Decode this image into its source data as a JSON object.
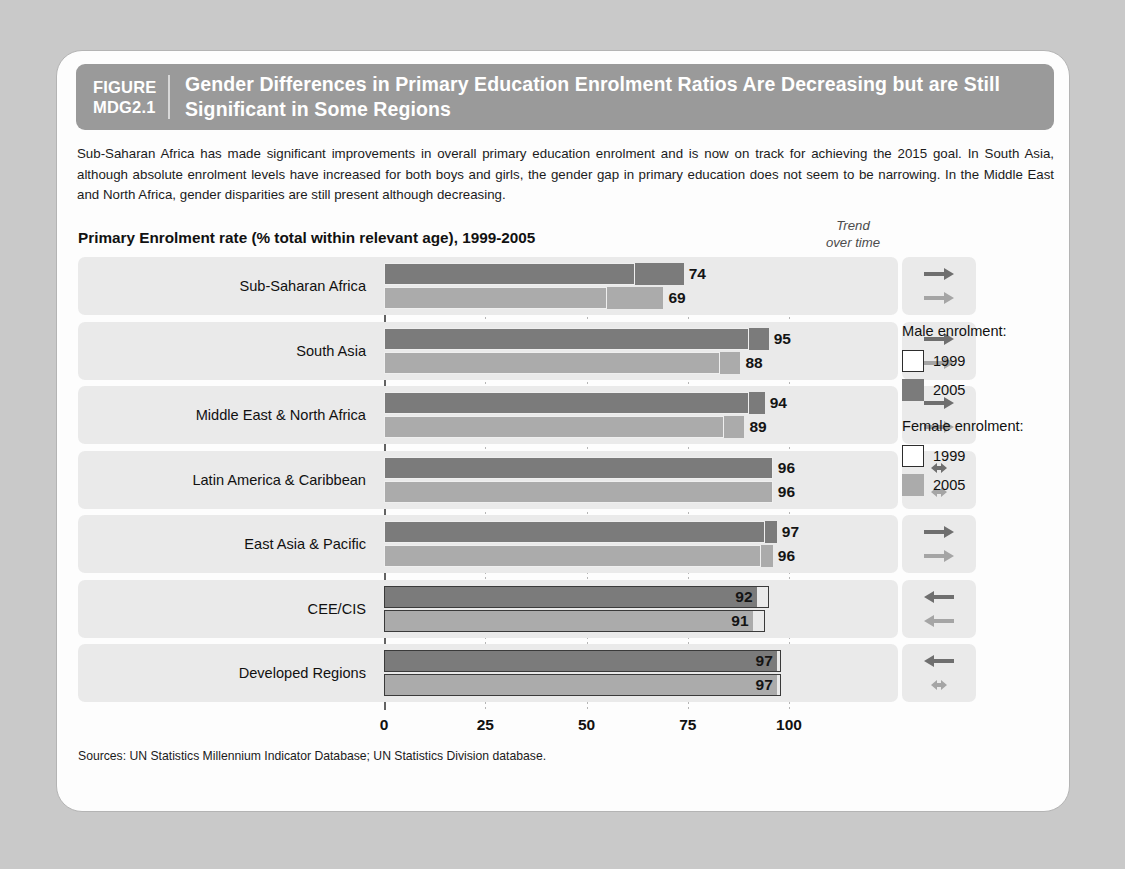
{
  "figure": {
    "number_line1": "FIGURE",
    "number_line2": "MDG2.1",
    "title": "Gender Differences in Primary Education Enrolment Ratios Are Decreasing but are Still Significant in Some Regions"
  },
  "intro": "Sub-Saharan Africa has made significant improvements in overall primary education enrolment and is now on track for achieving the 2015 goal. In South Asia, although absolute enrolment levels have increased for both boys and girls, the gender gap in primary education does not seem to be narrowing. In the Middle East and North Africa, gender disparities are still present although decreasing.",
  "chart_heading": "Primary Enrolment rate (% total within relevant age), 1999-2005",
  "trend_heading_line1": "Trend",
  "trend_heading_line2": "over time",
  "legend": {
    "male_title": "Male enrolment:",
    "male_1999": "1999",
    "male_2005": "2005",
    "female_title": "Female enrolment:",
    "female_1999": "1999",
    "female_2005": "2005"
  },
  "source": "Sources: UN Statistics Millennium Indicator Database; UN Statistics Division database.",
  "colors": {
    "male_2005": "#7b7b7b",
    "female_2005": "#ababab",
    "outline_1999": "#ffffff",
    "row_band": "#eaeaea",
    "header_band": "#9a9a9a",
    "page_background": "#c9c9c9",
    "card_background": "#fdfdfd"
  },
  "chart_data": {
    "type": "bar",
    "orientation": "horizontal",
    "title": "Primary Enrolment rate (% total within relevant age), 1999-2005",
    "xlabel": "",
    "ylabel": "",
    "xlim": [
      0,
      100
    ],
    "xticks": [
      "0",
      "25",
      "50",
      "75",
      "100"
    ],
    "xtick_values": [
      0,
      25,
      50,
      75,
      100
    ],
    "grid": true,
    "legend_position": "right",
    "categories": [
      "Sub-Saharan Africa",
      "South Asia",
      "Middle East & North Africa",
      "Latin America & Caribbean",
      "East Asia & Pacific",
      "CEE/CIS",
      "Developed Regions"
    ],
    "series": [
      {
        "name": "Male enrolment 2005",
        "values": [
          74,
          95,
          94,
          96,
          97,
          92,
          97
        ]
      },
      {
        "name": "Female enrolment 2005",
        "values": [
          69,
          88,
          89,
          96,
          96,
          91,
          97
        ]
      },
      {
        "name": "Male enrolment 1999",
        "values": [
          62,
          90,
          90,
          96,
          94,
          95,
          98
        ]
      },
      {
        "name": "Female enrolment 1999",
        "values": [
          55,
          83,
          84,
          96,
          93,
          94,
          98
        ]
      }
    ],
    "rows": [
      {
        "region": "Sub-Saharan Africa",
        "male_2005": 74,
        "male_1999": 62,
        "female_2005": 69,
        "female_1999": 55,
        "male_label": "74",
        "female_label": "69",
        "male_trend": "arrow-right",
        "female_trend": "arrow-right"
      },
      {
        "region": "South Asia",
        "male_2005": 95,
        "male_1999": 90,
        "female_2005": 88,
        "female_1999": 83,
        "male_label": "95",
        "female_label": "88",
        "male_trend": "arrow-right",
        "female_trend": "arrow-right"
      },
      {
        "region": "Middle East & North Africa",
        "male_2005": 94,
        "male_1999": 90,
        "female_2005": 89,
        "female_1999": 84,
        "male_label": "94",
        "female_label": "89",
        "male_trend": "arrow-right",
        "female_trend": "arrow-right"
      },
      {
        "region": "Latin America & Caribbean",
        "male_2005": 96,
        "male_1999": 96,
        "female_2005": 96,
        "female_1999": 96,
        "male_label": "96",
        "female_label": "96",
        "male_trend": "arrow-both",
        "female_trend": "arrow-both"
      },
      {
        "region": "East Asia & Pacific",
        "male_2005": 97,
        "male_1999": 94,
        "female_2005": 96,
        "female_1999": 93,
        "male_label": "97",
        "female_label": "96",
        "male_trend": "arrow-right",
        "female_trend": "arrow-right"
      },
      {
        "region": "CEE/CIS",
        "male_2005": 92,
        "male_1999": 95,
        "female_2005": 91,
        "female_1999": 94,
        "male_label": "92",
        "female_label": "91",
        "male_trend": "arrow-left",
        "female_trend": "arrow-left"
      },
      {
        "region": "Developed Regions",
        "male_2005": 97,
        "male_1999": 98,
        "female_2005": 97,
        "female_1999": 98,
        "male_label": "97",
        "female_label": "97",
        "male_trend": "arrow-left",
        "female_trend": "arrow-both"
      }
    ]
  }
}
